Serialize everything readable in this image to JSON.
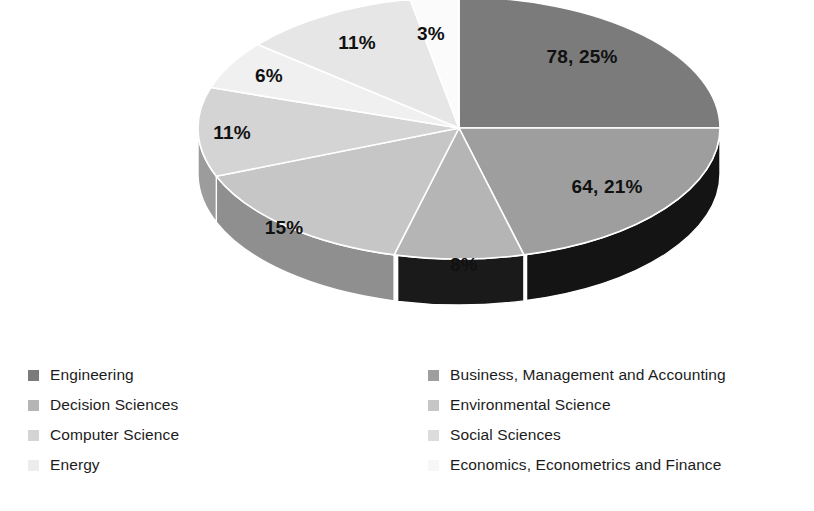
{
  "chart_data": {
    "type": "pie",
    "title": "",
    "subtitle": "",
    "three_d": true,
    "legend_position": "bottom",
    "grid": false,
    "categories": [
      "Engineering",
      "Business, Management and Accounting",
      "Decision Sciences",
      "Environmental Science",
      "Computer Science",
      "Social Sciences",
      "Energy",
      "Economics, Econometrics and Finance"
    ],
    "values": [
      78,
      64,
      25,
      46,
      34,
      18,
      34,
      9
    ],
    "percentages": [
      25,
      21,
      8,
      15,
      11,
      6,
      11,
      3
    ],
    "data_labels": [
      "78, 25%",
      "64, 21%",
      "8%",
      "15%",
      "11%",
      "6%",
      "11%",
      "3%"
    ],
    "slice_colors": [
      "#7b7b7b",
      "#9e9e9e",
      "#b5b5b5",
      "#c6c6c6",
      "#d4d4d4",
      "#f0f0f0",
      "#e6e6e6",
      "#fbfbfb"
    ]
  },
  "pie": {
    "center_x": 459,
    "center_y": 128,
    "radius_x": 261,
    "radius_y": 131,
    "depth": 46,
    "start_angle_deg": -90,
    "slices": [
      {
        "name": "engineering",
        "label": "78, 25%",
        "percent": 25,
        "value": 78,
        "top_color": "#7b7b7b",
        "side_color": "#5e5e5e",
        "label_x": 582,
        "label_y": 57
      },
      {
        "name": "business-management-accounting",
        "label": "64, 21%",
        "percent": 21,
        "value": 64,
        "top_color": "#9e9e9e",
        "side_color": "#141414",
        "label_x": 607,
        "label_y": 187
      },
      {
        "name": "decision-sciences",
        "label": "8%",
        "percent": 8,
        "value": 25,
        "top_color": "#b5b5b5",
        "side_color": "#1a1a1a",
        "label_x": 464,
        "label_y": 265
      },
      {
        "name": "environmental-science",
        "label": "15%",
        "percent": 15,
        "value": 46,
        "top_color": "#c6c6c6",
        "side_color": "#8f8f8f",
        "label_x": 284,
        "label_y": 228
      },
      {
        "name": "computer-science",
        "label": "11%",
        "percent": 11,
        "value": 34,
        "top_color": "#d4d4d4",
        "side_color": "#9c9c9c",
        "label_x": 232,
        "label_y": 133
      },
      {
        "name": "social-sciences",
        "label": "6%",
        "percent": 6,
        "value": 18,
        "top_color": "#f0f0f0",
        "side_color": "#bcbcbc",
        "label_x": 269,
        "label_y": 76
      },
      {
        "name": "energy",
        "label": "11%",
        "percent": 11,
        "value": 34,
        "top_color": "#e6e6e6",
        "side_color": "#bdbdbd",
        "label_x": 357,
        "label_y": 43
      },
      {
        "name": "economics-econometrics-finance",
        "label": "3%",
        "percent": 3,
        "value": 9,
        "top_color": "#fbfbfb",
        "side_color": "#d8d8d8",
        "label_x": 431,
        "label_y": 34
      }
    ]
  },
  "legend": {
    "left_column": [
      {
        "label": "Engineering",
        "color": "#7b7b7b"
      },
      {
        "label": "Decision Sciences",
        "color": "#b5b5b5"
      },
      {
        "label": "Computer Science",
        "color": "#d4d4d4"
      },
      {
        "label": "Energy",
        "color": "#ececec"
      }
    ],
    "right_column": [
      {
        "label": "Business, Management and Accounting",
        "color": "#9e9e9e"
      },
      {
        "label": "Environmental Science",
        "color": "#c6c6c6"
      },
      {
        "label": "Social Sciences",
        "color": "#dcdcdc"
      },
      {
        "label": "Economics, Econometrics and Finance",
        "color": "#f7f7f7"
      }
    ]
  }
}
